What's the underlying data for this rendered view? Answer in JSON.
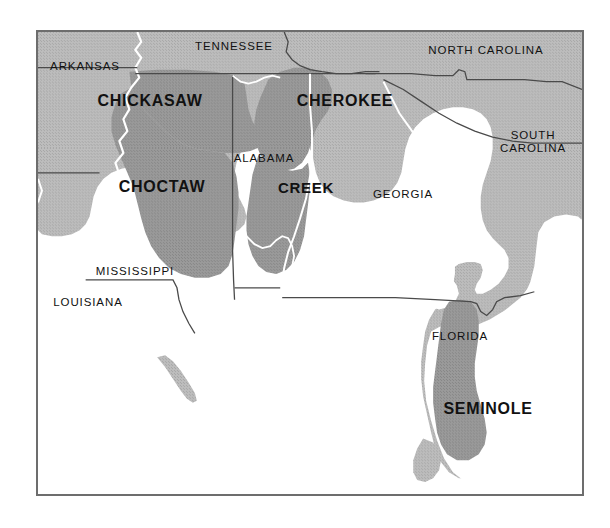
{
  "map": {
    "title": "Southeastern United States Native American Tribal Territories",
    "frame": {
      "border_color": "#6d6d6d",
      "background_color": "#ffffff"
    },
    "colors": {
      "ocean": "#ffffff",
      "land": "#b6b6b6",
      "tribal_territory": "#8f8f8f",
      "state_boundary": "#4a4a4a",
      "coastline": "#ffffff",
      "label_text": "#111111",
      "frame_border": "#6d6d6d"
    },
    "states": [
      {
        "id": "arkansas",
        "name": "ARKANSAS",
        "x": 2,
        "y": 28,
        "w": 90,
        "lines": 1
      },
      {
        "id": "tennessee",
        "name": "TENNESSEE",
        "x": 150,
        "y": 8,
        "w": 92,
        "lines": 1
      },
      {
        "id": "north-carolina",
        "name": "NORTH CAROLINA",
        "x": 374,
        "y": 12,
        "w": 148,
        "lines": 1
      },
      {
        "id": "south-carolina",
        "name": "SOUTH\nCAROLINA",
        "x": 440,
        "y": 97,
        "w": 110,
        "lines": 2
      },
      {
        "id": "alabama",
        "name": "ALABAMA",
        "x": 182,
        "y": 120,
        "w": 88,
        "lines": 1
      },
      {
        "id": "georgia",
        "name": "GEORGIA",
        "x": 322,
        "y": 156,
        "w": 86,
        "lines": 1
      },
      {
        "id": "mississippi",
        "name": "MISSISSIPPI",
        "x": 48,
        "y": 233,
        "w": 98,
        "lines": 1
      },
      {
        "id": "louisiana",
        "name": "LOUISIANA",
        "x": 2,
        "y": 264,
        "w": 96,
        "lines": 1
      },
      {
        "id": "florida",
        "name": "FLORIDA",
        "x": 380,
        "y": 298,
        "w": 84,
        "lines": 1
      }
    ],
    "tribes": [
      {
        "id": "chickasaw",
        "name": "CHICKASAW",
        "x": 50,
        "y": 60,
        "w": 124,
        "size": "normal"
      },
      {
        "id": "choctaw",
        "name": "CHOCTAW",
        "x": 72,
        "y": 146,
        "w": 104,
        "size": "normal"
      },
      {
        "id": "cherokee",
        "name": "CHEROKEE",
        "x": 252,
        "y": 60,
        "w": 110,
        "size": "normal"
      },
      {
        "id": "creek",
        "name": "CREEK",
        "x": 233,
        "y": 147,
        "w": 70,
        "size": "small"
      },
      {
        "id": "seminole",
        "name": "SEMINOLE",
        "x": 390,
        "y": 368,
        "w": 120,
        "size": "normal"
      }
    ]
  }
}
